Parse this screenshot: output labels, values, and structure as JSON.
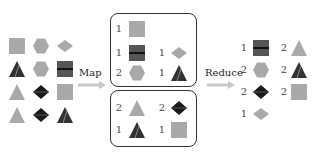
{
  "colors": {
    "gray": "#a9a9a9",
    "dark": "#3a3a3a",
    "black": "#1a1a1a",
    "border": "#333333"
  },
  "input": {
    "shapes": [
      [
        "square",
        "hexagon",
        "diamond"
      ],
      [
        "dark-triangle",
        "hexagon",
        "dark-square"
      ],
      [
        "triangle",
        "black-diamond",
        "square"
      ],
      [
        "triangle",
        "black-diamond",
        "dark-triangle"
      ]
    ]
  },
  "map": {
    "label": "Map",
    "groups": [
      {
        "items": [
          {
            "count": "1",
            "shape": "square"
          },
          {
            "count": "1",
            "shape": "dark-square"
          },
          {
            "count": "1",
            "shape": "diamond"
          },
          {
            "count": "2",
            "shape": "hexagon"
          },
          {
            "count": "1",
            "shape": "dark-triangle"
          }
        ]
      },
      {
        "items": [
          {
            "count": "2",
            "shape": "triangle"
          },
          {
            "count": "2",
            "shape": "black-diamond"
          },
          {
            "count": "1",
            "shape": "dark-triangle"
          },
          {
            "count": "1",
            "shape": "square"
          }
        ]
      }
    ]
  },
  "reduce": {
    "label": "Reduce",
    "items": [
      {
        "count": "1",
        "shape": "dark-square"
      },
      {
        "count": "2",
        "shape": "triangle"
      },
      {
        "count": "2",
        "shape": "hexagon"
      },
      {
        "count": "2",
        "shape": "dark-triangle"
      },
      {
        "count": "2",
        "shape": "black-diamond"
      },
      {
        "count": "2",
        "shape": "square"
      },
      {
        "count": "1",
        "shape": "diamond"
      }
    ]
  }
}
